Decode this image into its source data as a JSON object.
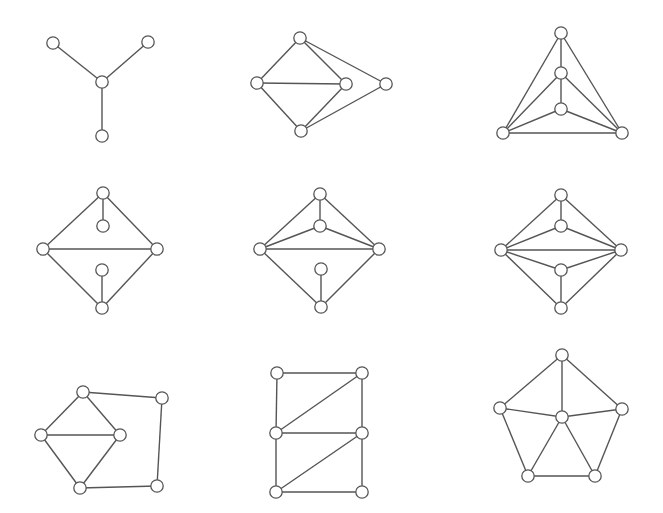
{
  "figure": {
    "style": {
      "stroke_color": "#555555",
      "node_fill": "#ffffff",
      "background": "#ffffff"
    },
    "graphs": [
      {
        "id": "graph-1",
        "name": "claw / star K1,3",
        "nodes": [
          [
            53,
            43
          ],
          [
            148,
            42
          ],
          [
            102,
            82
          ],
          [
            102,
            136
          ]
        ],
        "edges": [
          [
            0,
            2
          ],
          [
            1,
            2
          ],
          [
            2,
            3
          ]
        ]
      },
      {
        "id": "graph-2",
        "name": "diamond with extra vertex",
        "nodes": [
          [
            300,
            38
          ],
          [
            257,
            83
          ],
          [
            346,
            84
          ],
          [
            386,
            84
          ],
          [
            301,
            131
          ]
        ],
        "edges": [
          [
            0,
            1
          ],
          [
            0,
            2
          ],
          [
            0,
            3
          ],
          [
            1,
            2
          ],
          [
            1,
            4
          ],
          [
            2,
            4
          ],
          [
            3,
            4
          ]
        ]
      },
      {
        "id": "graph-3",
        "name": "triangle with nested path",
        "nodes": [
          [
            561,
            33
          ],
          [
            561,
            73
          ],
          [
            561,
            109
          ],
          [
            503,
            133
          ],
          [
            622,
            133
          ]
        ],
        "edges": [
          [
            0,
            1
          ],
          [
            1,
            2
          ],
          [
            0,
            3
          ],
          [
            0,
            4
          ],
          [
            1,
            3
          ],
          [
            1,
            4
          ],
          [
            2,
            3
          ],
          [
            2,
            4
          ],
          [
            3,
            4
          ]
        ]
      },
      {
        "id": "graph-4",
        "name": "rhombus with two pendants",
        "nodes": [
          [
            103,
            193
          ],
          [
            103,
            226
          ],
          [
            43,
            249
          ],
          [
            157,
            249
          ],
          [
            102,
            270
          ],
          [
            102,
            308
          ]
        ],
        "edges": [
          [
            0,
            1
          ],
          [
            0,
            2
          ],
          [
            0,
            3
          ],
          [
            2,
            3
          ],
          [
            2,
            5
          ],
          [
            3,
            5
          ],
          [
            4,
            5
          ]
        ]
      },
      {
        "id": "graph-5",
        "name": "rhombus with inner vertex and pendant",
        "nodes": [
          [
            320,
            194
          ],
          [
            320,
            226
          ],
          [
            260,
            249
          ],
          [
            379,
            249
          ],
          [
            321,
            269
          ],
          [
            321,
            307
          ]
        ],
        "edges": [
          [
            0,
            1
          ],
          [
            0,
            2
          ],
          [
            0,
            3
          ],
          [
            1,
            2
          ],
          [
            1,
            3
          ],
          [
            2,
            3
          ],
          [
            2,
            5
          ],
          [
            3,
            5
          ],
          [
            4,
            5
          ]
        ]
      },
      {
        "id": "graph-6",
        "name": "rhombus with two inner vertices",
        "nodes": [
          [
            561,
            195
          ],
          [
            561,
            226
          ],
          [
            501,
            250
          ],
          [
            621,
            250
          ],
          [
            561,
            270
          ],
          [
            561,
            308
          ]
        ],
        "edges": [
          [
            0,
            1
          ],
          [
            0,
            2
          ],
          [
            0,
            3
          ],
          [
            1,
            2
          ],
          [
            1,
            3
          ],
          [
            2,
            3
          ],
          [
            2,
            4
          ],
          [
            3,
            4
          ],
          [
            4,
            5
          ],
          [
            2,
            5
          ],
          [
            3,
            5
          ]
        ]
      },
      {
        "id": "graph-7",
        "name": "diamond with outer path",
        "nodes": [
          [
            83,
            392
          ],
          [
            162,
            398
          ],
          [
            41,
            435
          ],
          [
            120,
            435
          ],
          [
            80,
            488
          ],
          [
            157,
            486
          ]
        ],
        "edges": [
          [
            0,
            1
          ],
          [
            0,
            2
          ],
          [
            0,
            3
          ],
          [
            2,
            3
          ],
          [
            2,
            4
          ],
          [
            3,
            4
          ],
          [
            1,
            5
          ],
          [
            4,
            5
          ]
        ]
      },
      {
        "id": "graph-8",
        "name": "triangulated ladder",
        "nodes": [
          [
            277,
            373
          ],
          [
            362,
            373
          ],
          [
            276,
            433
          ],
          [
            362,
            433
          ],
          [
            276,
            492
          ],
          [
            362,
            492
          ]
        ],
        "edges": [
          [
            0,
            1
          ],
          [
            0,
            2
          ],
          [
            1,
            2
          ],
          [
            1,
            3
          ],
          [
            2,
            3
          ],
          [
            2,
            4
          ],
          [
            3,
            4
          ],
          [
            3,
            5
          ],
          [
            4,
            5
          ]
        ]
      },
      {
        "id": "graph-9",
        "name": "wheel W5",
        "nodes": [
          [
            562,
            355
          ],
          [
            500,
            408
          ],
          [
            622,
            409
          ],
          [
            562,
            417
          ],
          [
            528,
            476
          ],
          [
            595,
            476
          ]
        ],
        "edges": [
          [
            0,
            1
          ],
          [
            0,
            2
          ],
          [
            0,
            3
          ],
          [
            1,
            3
          ],
          [
            2,
            3
          ],
          [
            1,
            4
          ],
          [
            2,
            5
          ],
          [
            3,
            4
          ],
          [
            3,
            5
          ],
          [
            4,
            5
          ]
        ]
      }
    ]
  }
}
